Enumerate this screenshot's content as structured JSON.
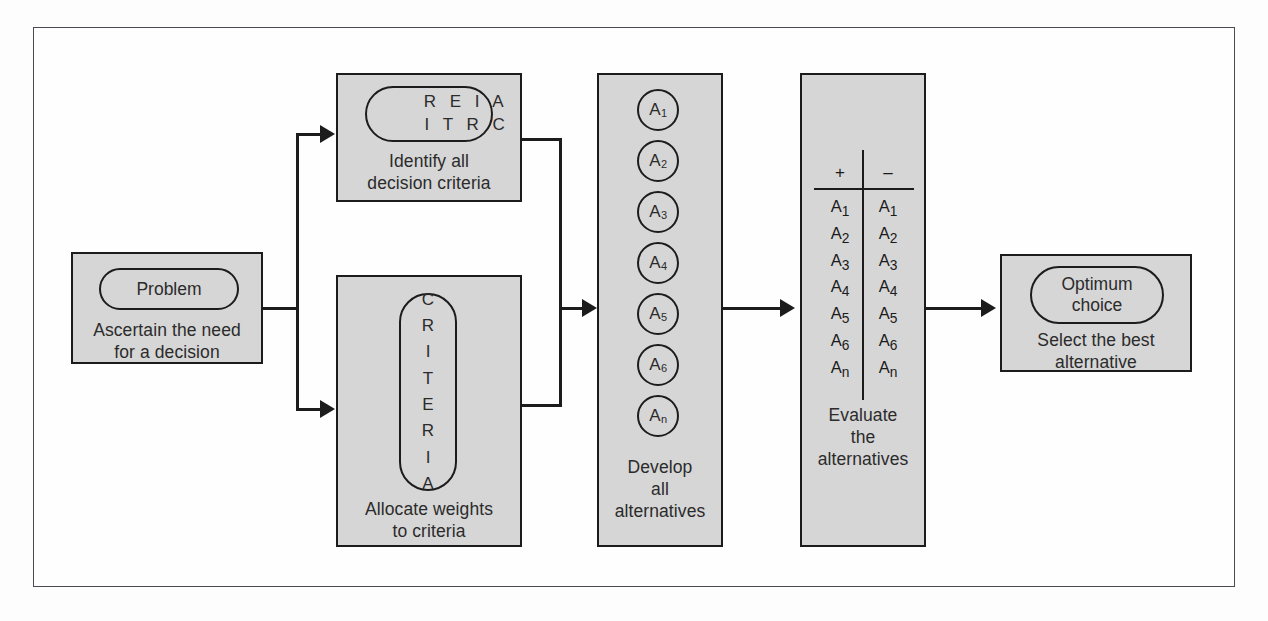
{
  "diagram": {
    "accent_fill": "#d6d6d6",
    "stroke": "#1c1c1c",
    "frame_stroke": "#4a4a52",
    "background": "#ffffff"
  },
  "steps": {
    "problem": {
      "pill_label": "Problem",
      "caption_line1": "Ascertain the need",
      "caption_line2": "for a decision"
    },
    "identify_criteria": {
      "scatter_row1": "R E I A",
      "scatter_row2": "I T R C",
      "caption_line1": "Identify all",
      "caption_line2": "decision criteria"
    },
    "allocate_weights": {
      "vertical_letters": [
        "C",
        "R",
        "I",
        "T",
        "E",
        "R",
        "I",
        "A"
      ],
      "caption_line1": "Allocate weights",
      "caption_line2": "to criteria"
    },
    "develop_alternatives": {
      "circles": [
        "A1",
        "A2",
        "A3",
        "A4",
        "A5",
        "A6",
        "An"
      ],
      "circle_base": "A",
      "circle_subs": [
        "1",
        "2",
        "3",
        "4",
        "5",
        "6",
        "n"
      ],
      "caption_line1": "Develop",
      "caption_line2": "all",
      "caption_line3": "alternatives"
    },
    "evaluate_alternatives": {
      "header_plus": "+",
      "header_minus": "–",
      "column_plus": [
        "1",
        "2",
        "3",
        "4",
        "5",
        "6",
        "n"
      ],
      "column_minus": [
        "1",
        "2",
        "3",
        "4",
        "5",
        "6",
        "n"
      ],
      "item_base": "A",
      "caption_line1": "Evaluate",
      "caption_line2": "the",
      "caption_line3": "alternatives"
    },
    "optimum_choice": {
      "pill_line1": "Optimum",
      "pill_line2": "choice",
      "caption_line1": "Select the best",
      "caption_line2": "alternative"
    }
  }
}
